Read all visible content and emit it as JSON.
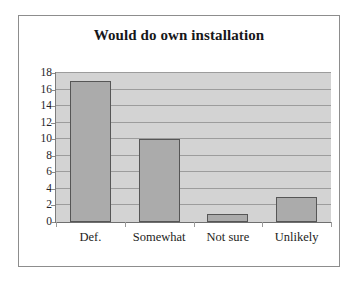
{
  "chart_data": {
    "type": "bar",
    "title": "Would do own installation",
    "categories": [
      "Def.",
      "Somewhat",
      "Not sure",
      "Unlikely"
    ],
    "values": [
      17,
      10,
      1,
      3
    ],
    "xlabel": "",
    "ylabel": "",
    "ylim": [
      0,
      18
    ],
    "ytick_labels": [
      "18",
      "16",
      "14",
      "12",
      "10",
      "8",
      "6",
      "4",
      "2",
      "0"
    ],
    "ytick_values": [
      18,
      16,
      14,
      12,
      10,
      8,
      6,
      4,
      2,
      0
    ],
    "ytick_step": 2,
    "grid": true,
    "grid_axis": "y",
    "legend": false,
    "legend_position": "none",
    "series": [
      {
        "name": "Would do own installation",
        "values": [
          17,
          10,
          1,
          3
        ]
      }
    ],
    "colors": {
      "bar_fill": "#ababab",
      "bar_border": "#565656",
      "plot_background": "#d3d3d3",
      "gridline": "#9c9c9c",
      "frame_border": "#8d8d8d",
      "page_background": "#ffffff",
      "text": "#1d1d22"
    }
  }
}
